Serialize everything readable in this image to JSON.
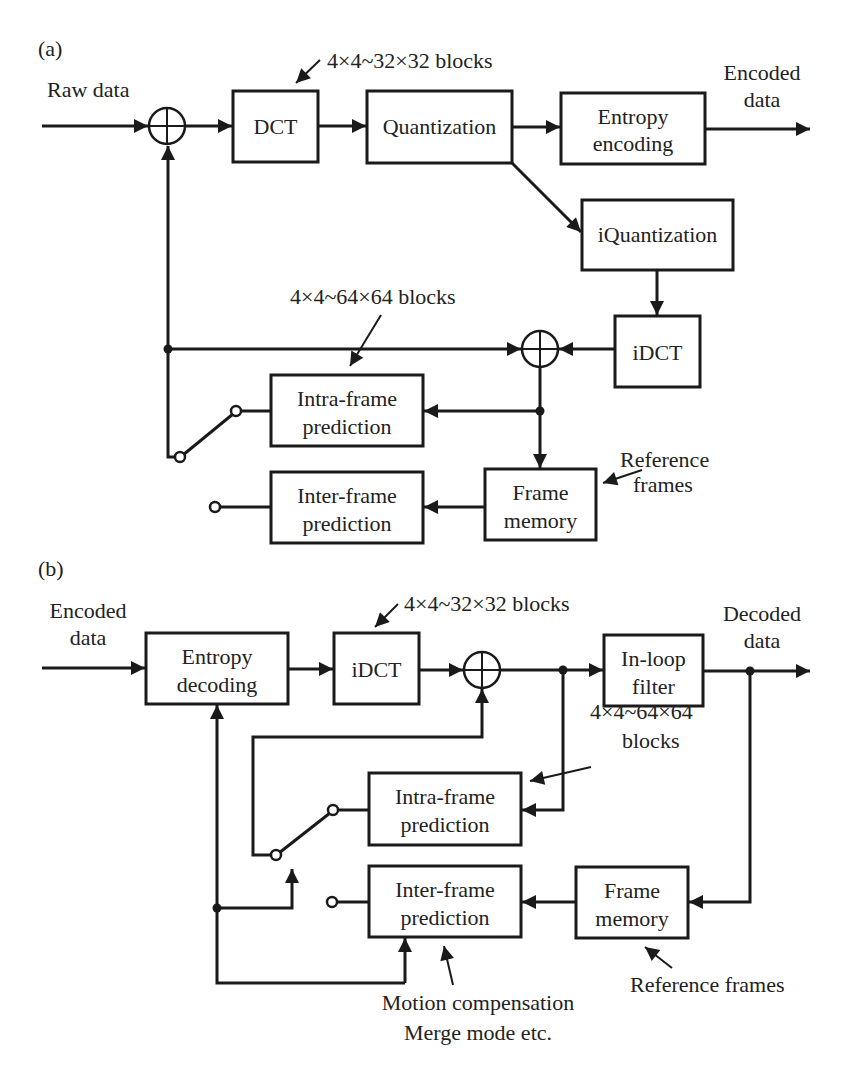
{
  "panel_a": {
    "label": "(a)",
    "input_label": "Raw data",
    "output_label_line1": "Encoded",
    "output_label_line2": "data",
    "blocks": {
      "dct": "DCT",
      "quantization": "Quantization",
      "entropy_encoding_line1": "Entropy",
      "entropy_encoding_line2": "encoding",
      "iquantization": "iQuantization",
      "idct": "iDCT",
      "intra_line1": "Intra-frame",
      "intra_line2": "prediction",
      "inter_line1": "Inter-frame",
      "inter_line2": "prediction",
      "frame_memory_line1": "Frame",
      "frame_memory_line2": "memory"
    },
    "annotations": {
      "transform_block_size": "4×4~32×32 blocks",
      "prediction_block_size": "4×4~64×64 blocks",
      "reference_frames_line1": "Reference",
      "reference_frames_line2": "frames"
    }
  },
  "panel_b": {
    "label": "(b)",
    "input_label_line1": "Encoded",
    "input_label_line2": "data",
    "output_label_line1": "Decoded",
    "output_label_line2": "data",
    "blocks": {
      "entropy_decoding_line1": "Entropy",
      "entropy_decoding_line2": "decoding",
      "idct": "iDCT",
      "inloop_line1": "In-loop",
      "inloop_line2": "filter",
      "intra_line1": "Intra-frame",
      "intra_line2": "prediction",
      "inter_line1": "Inter-frame",
      "inter_line2": "prediction",
      "frame_memory_line1": "Frame",
      "frame_memory_line2": "memory"
    },
    "annotations": {
      "transform_block_size": "4×4~32×32 blocks",
      "prediction_block_size_line1": "4×4~64×64",
      "prediction_block_size_line2": "blocks",
      "reference_frames": "Reference frames",
      "motion_line1": "Motion compensation",
      "motion_line2": "Merge mode etc."
    }
  }
}
